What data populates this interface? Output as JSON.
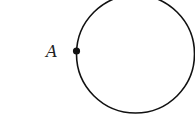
{
  "diagram": {
    "shape": "circle",
    "point_label": "A",
    "stroke_color": "#111111",
    "point_color": "#111111"
  }
}
